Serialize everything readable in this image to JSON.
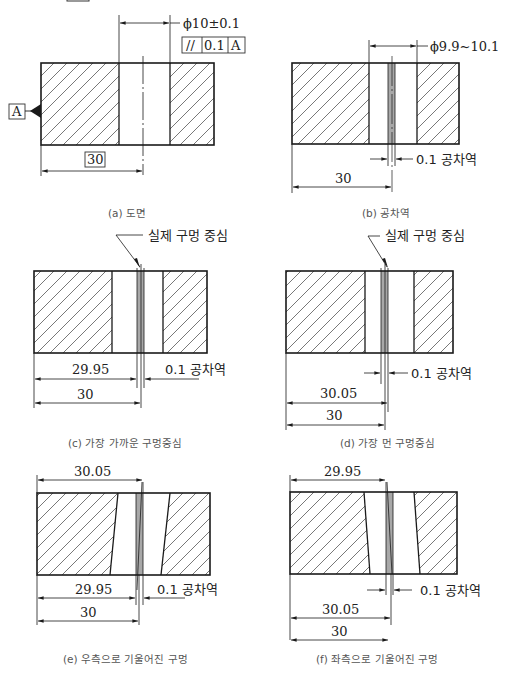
{
  "figures": {
    "a": {
      "caption": "(a) 도면",
      "diameter_label": "ϕ10±0.1",
      "fcf": {
        "symbol": "//",
        "tolerance": "0.1",
        "datum": "A"
      },
      "datum_label": "A",
      "position_label": "30"
    },
    "b": {
      "caption": "(b) 공차역",
      "diameter_label": "ϕ9.9~10.1",
      "zone_label": "0.1 공차역",
      "position_label": "30"
    },
    "c": {
      "caption": "(c) 가장 가까운 구멍중심",
      "center_label": "실제 구멍 중심",
      "near_label": "29.95",
      "zone_label": "0.1 공차역",
      "position_label": "30"
    },
    "d": {
      "caption": "(d) 가장 먼 구멍중심",
      "center_label": "실제 구멍 중심",
      "zone_label": "0.1 공차역",
      "far_label": "30.05",
      "position_label": "30"
    },
    "e": {
      "caption": "(e) 우측으로 기울어진 구멍",
      "top_label": "30.05",
      "near_label": "29.95",
      "zone_label": "0.1 공차역",
      "position_label": "30"
    },
    "f": {
      "caption": "(f) 좌측으로 기울어진 구멍",
      "top_label": "29.95",
      "zone_label": "0.1 공차역",
      "far_label": "30.05",
      "position_label": "30"
    }
  },
  "colors": {
    "line": "#1a1a1a",
    "hatch": "#555555",
    "zone": "#a8a8a8",
    "caption": "#555555"
  }
}
